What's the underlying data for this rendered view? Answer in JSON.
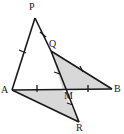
{
  "figure": {
    "type": "geometry-diagram",
    "width": 124,
    "height": 134,
    "background_color": "#ffffff",
    "stroke_color": "#1a1a1a",
    "shade_color": "#d8d8d8",
    "points": {
      "P": {
        "label": "P",
        "x": 35,
        "y": 18,
        "label_x": 29,
        "label_y": 2
      },
      "Q": {
        "label": "Q",
        "x": 51,
        "y": 51,
        "label_x": 49,
        "label_y": 39
      },
      "A": {
        "label": "A",
        "x": 12,
        "y": 90,
        "label_x": 2,
        "label_y": 85
      },
      "B": {
        "label": "B",
        "x": 112,
        "y": 89,
        "label_x": 114,
        "label_y": 84
      },
      "M": {
        "label": "M",
        "x": 63,
        "y": 90,
        "label_x": 64,
        "label_y": 91
      },
      "R": {
        "label": "R",
        "x": 79,
        "y": 122,
        "label_x": 76,
        "label_y": 123
      }
    },
    "segments": [
      {
        "name": "segment-AP",
        "from": "A",
        "to": "P",
        "ticks": 1
      },
      {
        "name": "segment-PQ",
        "from": "P",
        "to": "Q",
        "ticks": 1
      },
      {
        "name": "segment-QB",
        "from": "Q",
        "to": "B",
        "ticks": 1
      },
      {
        "name": "segment-AB",
        "from": "A",
        "to": "B",
        "ticks": 0
      },
      {
        "name": "segment-AM",
        "from": "A",
        "to": "M",
        "ticks": 1
      },
      {
        "name": "segment-MB",
        "from": "M",
        "to": "B",
        "ticks": 1
      },
      {
        "name": "segment-QR",
        "from": "Q",
        "to": "R",
        "ticks": 0
      },
      {
        "name": "segment-MR",
        "from": "M",
        "to": "R",
        "ticks": 1
      },
      {
        "name": "segment-AR",
        "from": "A",
        "to": "R",
        "ticks": 0
      }
    ],
    "shaded_regions": [
      {
        "name": "shaded-triangle-QMB",
        "vertices": [
          "Q",
          "M",
          "B"
        ]
      },
      {
        "name": "shaded-triangle-AMR",
        "vertices": [
          "A",
          "M",
          "R"
        ]
      }
    ]
  }
}
